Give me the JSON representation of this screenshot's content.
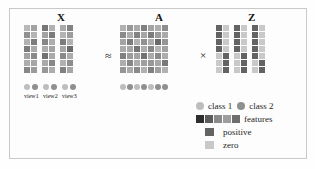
{
  "figure": {
    "operators": {
      "approx": "≈",
      "times": "×"
    },
    "titles": {
      "x": "X",
      "a": "A",
      "z": "Z"
    }
  },
  "matrices": {
    "X": {
      "label": "X",
      "rows": 7,
      "block_cols": 2,
      "blocks": 3,
      "view_labels": [
        "view1",
        "view2",
        "view3"
      ],
      "data": [
        [
          [
            0.18,
            0.3
          ],
          [
            0.55,
            0.22
          ],
          [
            0.26,
            0.48
          ]
        ],
        [
          [
            0.4,
            0.2
          ],
          [
            0.3,
            0.52
          ],
          [
            0.2,
            0.34
          ]
        ],
        [
          [
            0.22,
            0.52
          ],
          [
            0.46,
            0.24
          ],
          [
            0.52,
            0.22
          ]
        ],
        [
          [
            0.52,
            0.26
          ],
          [
            0.24,
            0.3
          ],
          [
            0.28,
            0.62
          ]
        ],
        [
          [
            0.3,
            0.44
          ],
          [
            0.58,
            0.26
          ],
          [
            0.44,
            0.24
          ]
        ],
        [
          [
            0.24,
            0.28
          ],
          [
            0.26,
            0.46
          ],
          [
            0.22,
            0.42
          ]
        ],
        [
          [
            0.46,
            0.34
          ],
          [
            0.36,
            0.24
          ],
          [
            0.5,
            0.28
          ]
        ]
      ]
    },
    "A": {
      "label": "A",
      "rows": 7,
      "cols": 7,
      "data": [
        [
          0.22,
          0.36,
          0.26,
          0.5,
          0.3,
          0.24,
          0.42
        ],
        [
          0.44,
          0.24,
          0.48,
          0.28,
          0.52,
          0.34,
          0.26
        ],
        [
          0.3,
          0.52,
          0.22,
          0.4,
          0.24,
          0.62,
          0.38
        ],
        [
          0.26,
          0.28,
          0.56,
          0.24,
          0.46,
          0.2,
          0.3
        ],
        [
          0.5,
          0.34,
          0.3,
          0.58,
          0.26,
          0.44,
          0.24
        ],
        [
          0.24,
          0.46,
          0.24,
          0.32,
          0.36,
          0.28,
          0.54
        ],
        [
          0.38,
          0.26,
          0.44,
          0.22,
          0.5,
          0.32,
          0.22
        ]
      ]
    },
    "Z": {
      "label": "Z",
      "rows": 7,
      "block_cols": 2,
      "blocks": 3,
      "data": [
        [
          [
            1,
            0
          ],
          [
            1,
            0
          ],
          [
            1,
            0
          ]
        ],
        [
          [
            1,
            0
          ],
          [
            1,
            0
          ],
          [
            1,
            0
          ]
        ],
        [
          [
            1,
            0
          ],
          [
            1,
            0
          ],
          [
            1,
            0
          ]
        ],
        [
          [
            1,
            0
          ],
          [
            1,
            0
          ],
          [
            1,
            0
          ]
        ],
        [
          [
            0,
            1
          ],
          [
            0,
            1
          ],
          [
            1,
            0
          ]
        ],
        [
          [
            0,
            1
          ],
          [
            0,
            1
          ],
          [
            0,
            1
          ]
        ],
        [
          [
            0,
            1
          ],
          [
            0,
            1
          ],
          [
            0,
            1
          ]
        ]
      ]
    }
  },
  "class_markers": {
    "x_groups": [
      [
        "class 1",
        "class 2"
      ],
      [
        "class 1",
        "class 2"
      ],
      [
        "class 1",
        "class 2"
      ]
    ],
    "a_row": [
      "class 1",
      "class 2",
      "class 1",
      "class 2",
      "class 1",
      "class 2",
      "class 2"
    ]
  },
  "legend": {
    "classes": [
      {
        "label": "class 1",
        "color": "#bdbdbd"
      },
      {
        "label": "class 2",
        "color": "#8f8f8f"
      }
    ],
    "features": {
      "label": "features",
      "swatches": [
        "#2e2e2e",
        "#5c5c5c",
        "#8a8a8a",
        "#9e9e9e",
        "#6e6e6e"
      ]
    },
    "positive": {
      "label": "positive",
      "color": "#636363"
    },
    "zero": {
      "label": "zero",
      "color": "#c9c9c9"
    }
  },
  "colors": {
    "background": "#fdfdfd",
    "frame": "#c9c9c9",
    "text": "#1a1a1a",
    "dark": "#2e2e2e",
    "light": "#cfcfcf"
  }
}
